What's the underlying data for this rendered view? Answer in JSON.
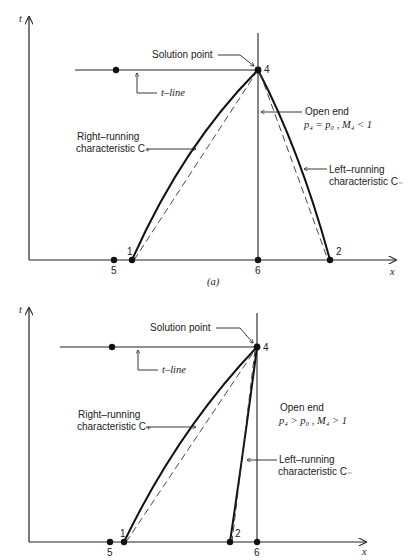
{
  "figure_a": {
    "caption": "(a)",
    "axis_t_label": "t",
    "axis_x_label": "x",
    "solution_point_label": "Solution point",
    "t_line_label": "t–line",
    "open_end_label": "Open end",
    "open_end_condition": "p₄ = p₀ ,  M₄ < 1",
    "right_running_line1": "Right–running",
    "right_running_line2": "characteristic C₊",
    "left_running_line1": "Left–running",
    "left_running_line2": "characteristic C₋",
    "points": {
      "p1": "1",
      "p2": "2",
      "p4": "4",
      "p5": "5",
      "p6": "6"
    }
  },
  "figure_b": {
    "axis_t_label": "t",
    "axis_x_label": "x",
    "solution_point_label": "Solution point",
    "t_line_label": "t–line",
    "open_end_label": "Open end",
    "open_end_condition": "p₄ > p₀ ,  M₄ > 1",
    "right_running_line1": "Right–running",
    "right_running_line2": "characteristic C₊",
    "left_running_line1": "Left–running",
    "left_running_line2": "characteristic C₋",
    "points": {
      "p1": "1",
      "p2": "2",
      "p4": "4",
      "p5": "5",
      "p6": "6"
    }
  }
}
